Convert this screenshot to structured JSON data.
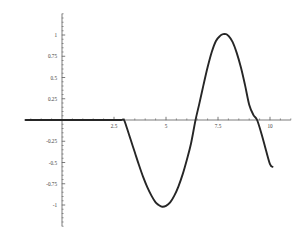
{
  "chart_data": {
    "type": "line",
    "title": "",
    "subtitle": "",
    "xlabel": "",
    "ylabel": "",
    "xlim": [
      -1.8,
      11.0
    ],
    "ylim": [
      -1.25,
      1.25
    ],
    "grid": false,
    "legend": null,
    "axis_style": "centered-cross",
    "x_ticks": [
      2.5,
      5,
      7.5,
      10
    ],
    "x_tick_labels": [
      "2.5",
      "5",
      "7.5",
      "10"
    ],
    "x_minor_tick_step": 0.5,
    "y_ticks": [
      1,
      0.75,
      0.5,
      0.25,
      -0.25,
      -0.5,
      -0.75,
      -1
    ],
    "y_tick_labels": [
      "1",
      "0.75",
      "0.5",
      "0.25",
      "-0.25",
      "-0.5",
      "-0.75",
      "-1"
    ],
    "y_minor_tick_step": 0.05,
    "series": [
      {
        "name": "curve",
        "color": "#262626",
        "line_width": 1.9,
        "annotations": [
          {
            "label": "flat-zero-start",
            "x": -1.75,
            "y": 0
          },
          {
            "label": "flat-zero-end",
            "x": 2.98,
            "y": 0
          },
          {
            "label": "minimum",
            "x": 4.82,
            "y": -1.02
          },
          {
            "label": "zero-crossing-up",
            "x": 6.42,
            "y": 0
          },
          {
            "label": "maximum",
            "x": 7.88,
            "y": 1.01
          },
          {
            "label": "zero-crossing-down",
            "x": 9.38,
            "y": 0
          },
          {
            "label": "endpoint",
            "x": 10.12,
            "y": -0.55
          }
        ],
        "x": [
          -1.75,
          -1.25,
          -0.75,
          -0.25,
          0.25,
          0.75,
          1.25,
          1.75,
          2.25,
          2.6,
          2.85,
          2.98,
          3.1,
          3.3,
          3.5,
          3.7,
          3.9,
          4.1,
          4.3,
          4.5,
          4.65,
          4.82,
          5.0,
          5.2,
          5.4,
          5.6,
          5.8,
          6.0,
          6.2,
          6.42,
          6.6,
          6.8,
          7.0,
          7.2,
          7.4,
          7.6,
          7.75,
          7.88,
          8.0,
          8.2,
          8.4,
          8.6,
          8.8,
          9.0,
          9.2,
          9.38,
          9.6,
          9.8,
          10.0,
          10.12
        ],
        "y": [
          0,
          0,
          0,
          0,
          0,
          0,
          0,
          0,
          0,
          0,
          0,
          0,
          -0.08,
          -0.23,
          -0.38,
          -0.53,
          -0.67,
          -0.79,
          -0.89,
          -0.97,
          -1.0,
          -1.02,
          -1.01,
          -0.97,
          -0.89,
          -0.78,
          -0.64,
          -0.47,
          -0.28,
          0.0,
          0.19,
          0.41,
          0.62,
          0.8,
          0.93,
          0.99,
          1.01,
          1.01,
          0.99,
          0.92,
          0.79,
          0.62,
          0.41,
          0.18,
          0.06,
          0.0,
          -0.17,
          -0.35,
          -0.52,
          -0.55
        ]
      }
    ]
  },
  "axes": {
    "x_axis_color": "#5a5a5a",
    "y_axis_color": "#5a5a5a",
    "background": "#ffffff"
  }
}
